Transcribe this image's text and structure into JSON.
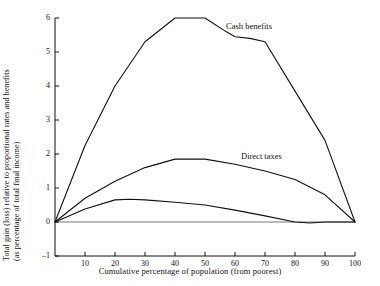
{
  "chart_data": {
    "type": "line",
    "title": "",
    "xlabel": "Cumulative percentage of population (from poorest)",
    "ylabel": "Total gain (loss) relative to proportional  rates and benefits (as percentage of total final income)",
    "ylabel_line1": "Total gain (loss) relative to proportional  rates and benefits",
    "ylabel_line2": "(as percentage of total final income)",
    "xlim": [
      0,
      100
    ],
    "ylim": [
      -1,
      6
    ],
    "xticks": [
      10,
      20,
      30,
      40,
      50,
      60,
      70,
      80,
      90,
      100
    ],
    "yticks": [
      -1,
      0,
      1,
      2,
      3,
      4,
      5,
      6
    ],
    "grid": false,
    "legend_position": "inline-annotations",
    "zero_line": true,
    "series": [
      {
        "name": "Cash benefits",
        "label_x": 57,
        "label_y": 5.75,
        "x": [
          0,
          10,
          20,
          30,
          40,
          50,
          57,
          60,
          65,
          70,
          80,
          90,
          100
        ],
        "values": [
          0,
          2.25,
          4.0,
          5.3,
          6.0,
          6.0,
          5.6,
          5.45,
          5.4,
          5.3,
          3.85,
          2.4,
          0
        ]
      },
      {
        "name": "Direct taxes",
        "label_x": 62,
        "label_y": 1.9,
        "x": [
          0,
          10,
          20,
          30,
          40,
          50,
          60,
          70,
          80,
          90,
          100
        ],
        "values": [
          0,
          0.7,
          1.2,
          1.6,
          1.85,
          1.85,
          1.7,
          1.5,
          1.25,
          0.8,
          0
        ]
      },
      {
        "name": "",
        "label_x": null,
        "label_y": null,
        "x": [
          0,
          10,
          20,
          25,
          30,
          40,
          50,
          60,
          70,
          80,
          85,
          90,
          100
        ],
        "values": [
          0,
          0.38,
          0.65,
          0.67,
          0.65,
          0.58,
          0.5,
          0.35,
          0.18,
          0.0,
          -0.03,
          0.0,
          0.0
        ]
      }
    ]
  },
  "annotations": {
    "cash_benefits": "Cash benefits",
    "direct_taxes": "Direct taxes"
  }
}
